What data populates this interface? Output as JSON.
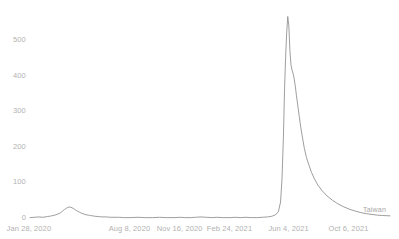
{
  "chart_data": {
    "type": "line",
    "title": "",
    "subtitle": "",
    "xlabel": "",
    "ylabel": "",
    "grid": false,
    "legend_position": "inline-right-end",
    "line_color": "#8c8c8c",
    "axis_text_color": "#b2b2b2",
    "background_color": "#ffffff",
    "ylim": [
      0,
      580
    ],
    "yticks": [
      0,
      100,
      200,
      300,
      400,
      500
    ],
    "ytick_labels": [
      "0",
      "100",
      "200",
      "300",
      "400",
      "500"
    ],
    "xtick_labels": [
      "Jan 28, 2020",
      "Aug 8, 2020",
      "Nov 16, 2020",
      "Feb 24, 2021",
      "Jun 4, 2021",
      "Oct 6, 2021"
    ],
    "xtick_positions_frac": [
      0.0,
      0.278,
      0.417,
      0.556,
      0.722,
      0.889
    ],
    "series": [
      {
        "name": "Taiwan",
        "color": "#8c8c8c",
        "x": [
          0.0,
          0.012,
          0.024,
          0.036,
          0.048,
          0.06,
          0.072,
          0.084,
          0.09,
          0.096,
          0.102,
          0.108,
          0.114,
          0.12,
          0.126,
          0.132,
          0.138,
          0.144,
          0.15,
          0.156,
          0.162,
          0.168,
          0.174,
          0.18,
          0.19,
          0.2,
          0.212,
          0.224,
          0.236,
          0.248,
          0.26,
          0.278,
          0.3,
          0.32,
          0.34,
          0.36,
          0.38,
          0.4,
          0.417,
          0.43,
          0.445,
          0.46,
          0.475,
          0.49,
          0.505,
          0.52,
          0.535,
          0.556,
          0.57,
          0.585,
          0.6,
          0.615,
          0.63,
          0.645,
          0.66,
          0.672,
          0.682,
          0.69,
          0.696,
          0.7,
          0.704,
          0.707,
          0.71,
          0.713,
          0.716,
          0.719,
          0.722,
          0.725,
          0.728,
          0.731,
          0.734,
          0.737,
          0.74,
          0.744,
          0.748,
          0.752,
          0.757,
          0.762,
          0.768,
          0.775,
          0.782,
          0.79,
          0.8,
          0.812,
          0.825,
          0.84,
          0.855,
          0.87,
          0.889,
          0.905,
          0.92,
          0.935,
          0.95,
          0.965,
          0.98,
          1.0
        ],
        "y": [
          1,
          2,
          3,
          2,
          4,
          6,
          9,
          14,
          19,
          24,
          28,
          31,
          30,
          27,
          23,
          19,
          16,
          13,
          11,
          9,
          8,
          7,
          6,
          5,
          4,
          3,
          3,
          2,
          2,
          2,
          1,
          1,
          2,
          1,
          1,
          2,
          1,
          1,
          2,
          1,
          1,
          2,
          3,
          2,
          1,
          2,
          1,
          1,
          2,
          1,
          2,
          1,
          1,
          2,
          3,
          5,
          9,
          18,
          45,
          110,
          230,
          360,
          450,
          520,
          566,
          540,
          470,
          430,
          415,
          405,
          390,
          370,
          345,
          315,
          285,
          255,
          225,
          196,
          170,
          148,
          128,
          110,
          92,
          76,
          62,
          50,
          40,
          32,
          24,
          19,
          15,
          12,
          10,
          8,
          7,
          6
        ]
      }
    ],
    "annotations": [
      {
        "text": "Taiwan",
        "x_frac": 0.925,
        "y_px": 210
      }
    ]
  }
}
